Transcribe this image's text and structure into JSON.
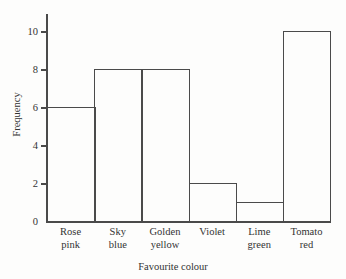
{
  "chart_data": {
    "type": "bar",
    "title": "",
    "subtitle": "",
    "xlabel": "Favourite colour",
    "ylabel": "Frequency",
    "categories": [
      "Rose pink",
      "Sky blue",
      "Golden yellow",
      "Violet",
      "Lime green",
      "Tomato red"
    ],
    "category_lines": [
      [
        "Rose",
        "pink"
      ],
      [
        "Sky",
        "blue"
      ],
      [
        "Golden",
        "yellow"
      ],
      [
        "Violet",
        ""
      ],
      [
        "Lime",
        "green"
      ],
      [
        "Tomato",
        "red"
      ]
    ],
    "values": [
      6,
      8,
      8,
      2,
      1,
      10
    ],
    "ylim": [
      0,
      10.95
    ],
    "yticks": [
      0,
      2,
      4,
      6,
      8,
      10
    ],
    "ytick_labels": [
      "0",
      "2",
      "4",
      "6",
      "8",
      "10"
    ],
    "grid": false,
    "legend": false,
    "bar_gap": 0,
    "colors": {
      "axis": "#4a4a4a",
      "bar_edge": "#4a4a4a",
      "bar_fill": "transparent",
      "text": "#333333",
      "background": "#fdfdfc"
    }
  }
}
